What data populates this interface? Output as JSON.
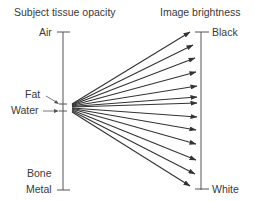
{
  "diagram": {
    "left_title": "Subject tissue opacity",
    "right_title": "Image brightness",
    "left_labels": {
      "air": "Air",
      "fat": "Fat",
      "water": "Water",
      "bone": "Bone",
      "metal": "Metal"
    },
    "right_labels": {
      "black": "Black",
      "white": "White"
    },
    "arrow_count": 13,
    "line_color": "#333333"
  }
}
